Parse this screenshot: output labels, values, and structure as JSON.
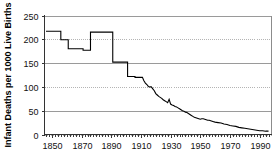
{
  "chart_data": {
    "type": "line",
    "title": "",
    "subtitle": "",
    "xlabel": "",
    "ylabel": "Infant Deaths per 1000 Live Births",
    "xlim": [
      1845,
      1998
    ],
    "ylim": [
      0,
      250
    ],
    "grid": true,
    "legend": null,
    "legend_position": "none",
    "y_ticks": [
      0,
      50,
      100,
      150,
      200,
      250
    ],
    "y_tick_labels": [
      "0",
      "50",
      "100",
      "150",
      "200",
      "250"
    ],
    "x_ticks": [
      1850,
      1870,
      1890,
      1910,
      1930,
      1950,
      1970,
      1990
    ],
    "x_tick_labels": [
      "1850",
      "1870",
      "1890",
      "1910",
      "1930",
      "1950",
      "1970",
      "1990"
    ],
    "gridline_styles": {
      "250": "solid",
      "200": "dotted",
      "150": "solid",
      "100": "dotted",
      "50": "solid",
      "0": "dotted"
    },
    "series": [
      {
        "name": "Infant mortality rate",
        "color": "#000000",
        "style": "step-then-line",
        "x": [
          1846,
          1856,
          1856,
          1861,
          1861,
          1871,
          1871,
          1876,
          1876,
          1881,
          1881,
          1891,
          1891,
          1896,
          1896,
          1901,
          1901,
          1906,
          1906,
          1911,
          1912,
          1913,
          1914,
          1915,
          1916,
          1917,
          1918,
          1919,
          1920,
          1921,
          1922,
          1923,
          1924,
          1925,
          1926,
          1927,
          1928,
          1929,
          1930,
          1931,
          1932,
          1933,
          1934,
          1935,
          1936,
          1937,
          1938,
          1939,
          1940,
          1941,
          1942,
          1943,
          1944,
          1945,
          1946,
          1947,
          1948,
          1949,
          1950,
          1951,
          1952,
          1953,
          1954,
          1955,
          1956,
          1957,
          1958,
          1959,
          1960,
          1962,
          1964,
          1966,
          1968,
          1970,
          1972,
          1974,
          1976,
          1978,
          1980,
          1982,
          1984,
          1986,
          1988,
          1990,
          1992,
          1994,
          1996
        ],
        "y": [
          217,
          217,
          199,
          199,
          180,
          180,
          177,
          177,
          215,
          215,
          215,
          215,
          152,
          152,
          152,
          152,
          122,
          122,
          120,
          120,
          113,
          108,
          105,
          101,
          100,
          100,
          96,
          92,
          86,
          83,
          80,
          78,
          76,
          73,
          71,
          69,
          67,
          74,
          64,
          62,
          61,
          59,
          58,
          56,
          54,
          52,
          50,
          49,
          47,
          46,
          44,
          42,
          40,
          38,
          36,
          35,
          34,
          33,
          32,
          33,
          33,
          32,
          31,
          30,
          30,
          29,
          28,
          27,
          26,
          25,
          24,
          22,
          21,
          19,
          18,
          17,
          15,
          14,
          13,
          12,
          11,
          10,
          9,
          8,
          8,
          7,
          7
        ]
      }
    ]
  },
  "axis": {
    "y_title": "Infant Deaths per 1000 Live Births"
  }
}
